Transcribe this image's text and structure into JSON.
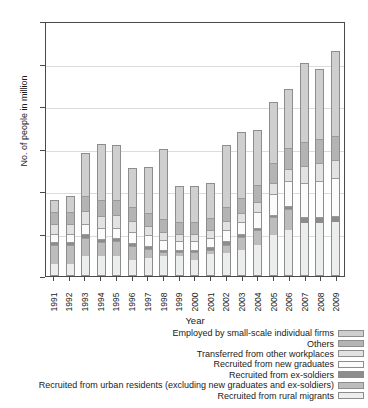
{
  "chart_data": {
    "type": "bar",
    "subtype": "stacked-bar",
    "title": "",
    "xlabel": "Year",
    "ylabel": "No. of people in million",
    "ylim": [
      0,
      30
    ],
    "yticks": [
      0,
      5,
      10,
      15,
      20,
      25,
      30
    ],
    "grid": true,
    "legend_position": "bottom-right",
    "categories": [
      "1991",
      "1992",
      "1993",
      "1994",
      "1995",
      "1996",
      "1997",
      "1998",
      "1999",
      "2000",
      "2001",
      "2002",
      "2003",
      "2004",
      "2005",
      "2006",
      "2007",
      "2008",
      "2009"
    ],
    "series": [
      {
        "name": "Recruited from rural migrants",
        "color": "#eceded",
        "values": [
          1.4,
          1.4,
          2.4,
          2.3,
          2.3,
          1.9,
          2.1,
          2.3,
          2.3,
          1.9,
          2.6,
          2.7,
          3.1,
          3.6,
          4.8,
          5.4,
          6.2,
          6.2,
          6.3
        ]
      },
      {
        "name": "Recruited from urban residents (excluding new graduates and ex-soldiers)",
        "color": "#bdbdbd",
        "values": [
          2.2,
          2.2,
          2.1,
          1.7,
          1.8,
          1.6,
          1.1,
          0.5,
          0.5,
          0.9,
          0.5,
          1.0,
          1.5,
          1.8,
          2.1,
          2.5,
          0.0,
          0.0,
          0.0
        ]
      },
      {
        "name": "Recruited from ex-soldiers",
        "color": "#8c8c8c",
        "values": [
          0.4,
          0.4,
          0.4,
          0.4,
          0.4,
          0.4,
          0.3,
          0.3,
          0.3,
          0.3,
          0.3,
          0.4,
          0.3,
          0.3,
          0.3,
          0.3,
          0.8,
          0.8,
          0.8
        ]
      },
      {
        "name": "Recruited from new graduates",
        "color": "#fbfbfb",
        "values": [
          1.0,
          1.0,
          1.2,
          1.2,
          1.2,
          1.3,
          1.3,
          1.1,
          1.0,
          1.0,
          1.1,
          1.3,
          1.4,
          1.8,
          2.4,
          3.0,
          4.0,
          4.2,
          4.4
        ]
      },
      {
        "name": "Transferred from other workplaces",
        "color": "#e2e2e2",
        "values": [
          1.1,
          1.1,
          1.5,
          1.5,
          1.5,
          1.3,
          1.1,
          1.0,
          0.9,
          0.9,
          0.9,
          1.1,
          1.1,
          1.2,
          1.4,
          1.4,
          2.0,
          2.1,
          2.1
        ]
      },
      {
        "name": "Others",
        "color": "#b4b4b4",
        "values": [
          1.4,
          1.4,
          1.8,
          1.8,
          1.8,
          1.6,
          1.5,
          1.5,
          1.4,
          1.4,
          1.4,
          1.6,
          1.8,
          2.0,
          2.3,
          2.5,
          2.8,
          2.8,
          2.9
        ]
      },
      {
        "name": "Employed by small-scale individual firms",
        "color": "#cfcfcf",
        "values": [
          1.5,
          1.9,
          5.1,
          6.6,
          6.4,
          4.6,
          5.4,
          8.3,
          4.2,
          4.2,
          4.1,
          7.3,
          7.7,
          6.5,
          7.2,
          6.9,
          9.3,
          8.3,
          10.0
        ]
      }
    ],
    "totals": [
      9.0,
      9.4,
      14.5,
      15.5,
      15.4,
      12.7,
      12.8,
      15.0,
      10.6,
      10.6,
      10.9,
      15.4,
      16.9,
      17.2,
      20.5,
      22.0,
      25.1,
      24.4,
      26.5
    ]
  },
  "axes": {
    "y_title": "No. of people in million",
    "x_title": "Year",
    "y_tick_labels": [
      "0",
      "5",
      "10",
      "15",
      "20",
      "25",
      "30"
    ],
    "x_tick_labels": [
      "1991",
      "1992",
      "1993",
      "1994",
      "1995",
      "1996",
      "1997",
      "1998",
      "1999",
      "2000",
      "2001",
      "2002",
      "2003",
      "2004",
      "2005",
      "2006",
      "2007",
      "2008",
      "2009"
    ]
  },
  "legend": {
    "items": [
      {
        "label": "Employed by small-scale individual firms",
        "color": "#cfcfcf"
      },
      {
        "label": "Others",
        "color": "#b4b4b4"
      },
      {
        "label": "Transferred from other workplaces",
        "color": "#e2e2e2"
      },
      {
        "label": "Recruited from new graduates",
        "color": "#fbfbfb"
      },
      {
        "label": "Recruited from ex-soldiers",
        "color": "#8c8c8c"
      },
      {
        "label": "Recruited from urban residents (excluding new graduates and ex-soldiers)",
        "color": "#bdbdbd"
      },
      {
        "label": "Recruited from rural migrants",
        "color": "#eceded"
      }
    ]
  },
  "top_sliver": {
    "text": ""
  }
}
